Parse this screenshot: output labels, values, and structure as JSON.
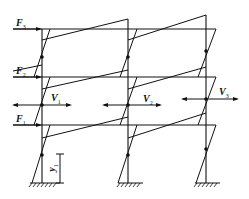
{
  "figure": {
    "type": "frame-moment-diagram"
  },
  "loads": [
    {
      "id": "F3",
      "symbol": "F",
      "subscript": "3",
      "level": 3
    },
    {
      "id": "F2",
      "symbol": "F",
      "subscript": "2",
      "level": 2
    },
    {
      "id": "F1",
      "symbol": "F",
      "subscript": "1",
      "level": 1
    }
  ],
  "shears": [
    {
      "id": "V1",
      "symbol": "V",
      "subscript": "1",
      "column": 1
    },
    {
      "id": "V2",
      "symbol": "V",
      "subscript": "2",
      "column": 2
    },
    {
      "id": "V3",
      "symbol": "V",
      "subscript": "3",
      "column": 3
    }
  ],
  "dimension": {
    "symbol": "y",
    "subscript": "1"
  },
  "labels": {
    "F3": {
      "main": "F",
      "sub": "3"
    },
    "F2": {
      "main": "F",
      "sub": "2"
    },
    "F1": {
      "main": "F",
      "sub": "1"
    },
    "V1": {
      "main": "V",
      "sub": "1"
    },
    "V2": {
      "main": "V",
      "sub": "2"
    },
    "V3": {
      "main": "V",
      "sub": "3"
    },
    "y1": {
      "main": "y",
      "sub": "1"
    }
  },
  "colors": {
    "line": "#111111",
    "background": "#ffffff"
  }
}
